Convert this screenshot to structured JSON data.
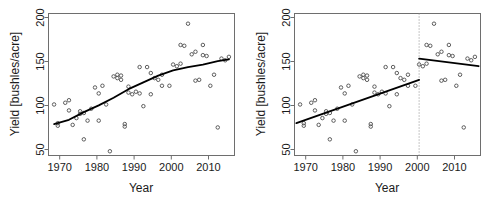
{
  "figure": {
    "background": "#ffffff",
    "panel_count": 2
  },
  "chart_data": [
    {
      "type": "scatter",
      "panel": "left",
      "title": "",
      "xlabel": "Year",
      "ylabel": "Yield [bushles/acre]",
      "xlim": [
        1966.5,
        2016.5
      ],
      "ylim": [
        38,
        205
      ],
      "xticks": [
        1970,
        1980,
        1990,
        2000,
        2010
      ],
      "yticks": [
        50,
        100,
        150,
        200
      ],
      "grid": false,
      "legend": null,
      "marker": "open-circle",
      "point_color": "#4d4d4d",
      "line_color": "#000000",
      "x": [
        1968,
        1969,
        1969,
        1971,
        1972,
        1972,
        1973,
        1974,
        1975,
        1975,
        1976,
        1976,
        1977,
        1978,
        1979,
        1980,
        1980,
        1981,
        1982,
        1983,
        1984,
        1985,
        1985,
        1986,
        1986,
        1987,
        1987,
        1988,
        1988,
        1989,
        1990,
        1991,
        1991,
        1992,
        1993,
        1994,
        1994,
        1995,
        1996,
        1997,
        1997,
        1999,
        2000,
        2001,
        2002,
        2002,
        2003,
        2004,
        2005,
        2006,
        2006,
        2007,
        2008,
        2008,
        2009,
        2010,
        2011,
        2012,
        2013,
        2014,
        2015
      ],
      "y": [
        98,
        73,
        76,
        100,
        103,
        91,
        74,
        82,
        87,
        90,
        57,
        88,
        79,
        93,
        118,
        79,
        111,
        120,
        98,
        43,
        131,
        129,
        133,
        127,
        132,
        72,
        75,
        112,
        119,
        110,
        113,
        111,
        142,
        96,
        142,
        110,
        135,
        129,
        127,
        120,
        133,
        120,
        145,
        143,
        146,
        168,
        167,
        193,
        157,
        160,
        126,
        127,
        168,
        156,
        155,
        120,
        133,
        71,
        152,
        150,
        154
      ],
      "fit": {
        "kind": "smooth-segmented",
        "description": "smoothed trend line rising from ~75 in 1968 to ~138 at 2000, then flattening to ~151 by 2015",
        "x": [
          1968,
          1972,
          1976,
          1980,
          1984,
          1988,
          1992,
          1996,
          2000,
          2004,
          2008,
          2012,
          2015
        ],
        "y": [
          75,
          80,
          89,
          97,
          106,
          116,
          124,
          132,
          138,
          142,
          145,
          149,
          151
        ]
      }
    },
    {
      "type": "scatter",
      "panel": "right",
      "title": "",
      "xlabel": "Year",
      "ylabel": "Yield [bushles/acre]",
      "xlim": [
        1966.5,
        2016.5
      ],
      "ylim": [
        38,
        205
      ],
      "xticks": [
        1970,
        1980,
        1990,
        2000,
        2010
      ],
      "yticks": [
        50,
        100,
        150,
        200
      ],
      "grid": false,
      "legend": null,
      "marker": "open-circle",
      "point_color": "#4d4d4d",
      "line_color": "#000000",
      "x": [
        1968,
        1969,
        1969,
        1971,
        1972,
        1972,
        1973,
        1974,
        1975,
        1975,
        1976,
        1976,
        1977,
        1978,
        1979,
        1980,
        1980,
        1981,
        1982,
        1983,
        1984,
        1985,
        1985,
        1986,
        1986,
        1987,
        1987,
        1988,
        1988,
        1989,
        1990,
        1991,
        1991,
        1992,
        1993,
        1994,
        1994,
        1995,
        1996,
        1997,
        1997,
        1999,
        2000,
        2001,
        2002,
        2002,
        2003,
        2004,
        2005,
        2006,
        2006,
        2007,
        2008,
        2008,
        2009,
        2010,
        2011,
        2012,
        2013,
        2014,
        2015
      ],
      "y": [
        98,
        73,
        76,
        100,
        103,
        91,
        74,
        82,
        87,
        90,
        57,
        88,
        79,
        93,
        118,
        79,
        111,
        120,
        98,
        43,
        131,
        129,
        133,
        127,
        132,
        72,
        75,
        112,
        119,
        110,
        113,
        111,
        142,
        96,
        142,
        110,
        135,
        129,
        127,
        120,
        133,
        120,
        145,
        143,
        146,
        168,
        167,
        193,
        157,
        160,
        126,
        127,
        168,
        156,
        155,
        120,
        133,
        71,
        152,
        150,
        154
      ],
      "breakpoint": {
        "x": 2000,
        "style": "dotted-vertical",
        "color": "#8c8c8c"
      },
      "fit": {
        "kind": "piecewise-linear",
        "segments": [
          {
            "name": "pre-2000",
            "x": [
              1967,
              2000
            ],
            "y": [
              76,
              127
            ]
          },
          {
            "name": "post-2000",
            "x": [
              2000,
              2016
            ],
            "y": [
              152,
              143
            ]
          }
        ]
      }
    }
  ]
}
